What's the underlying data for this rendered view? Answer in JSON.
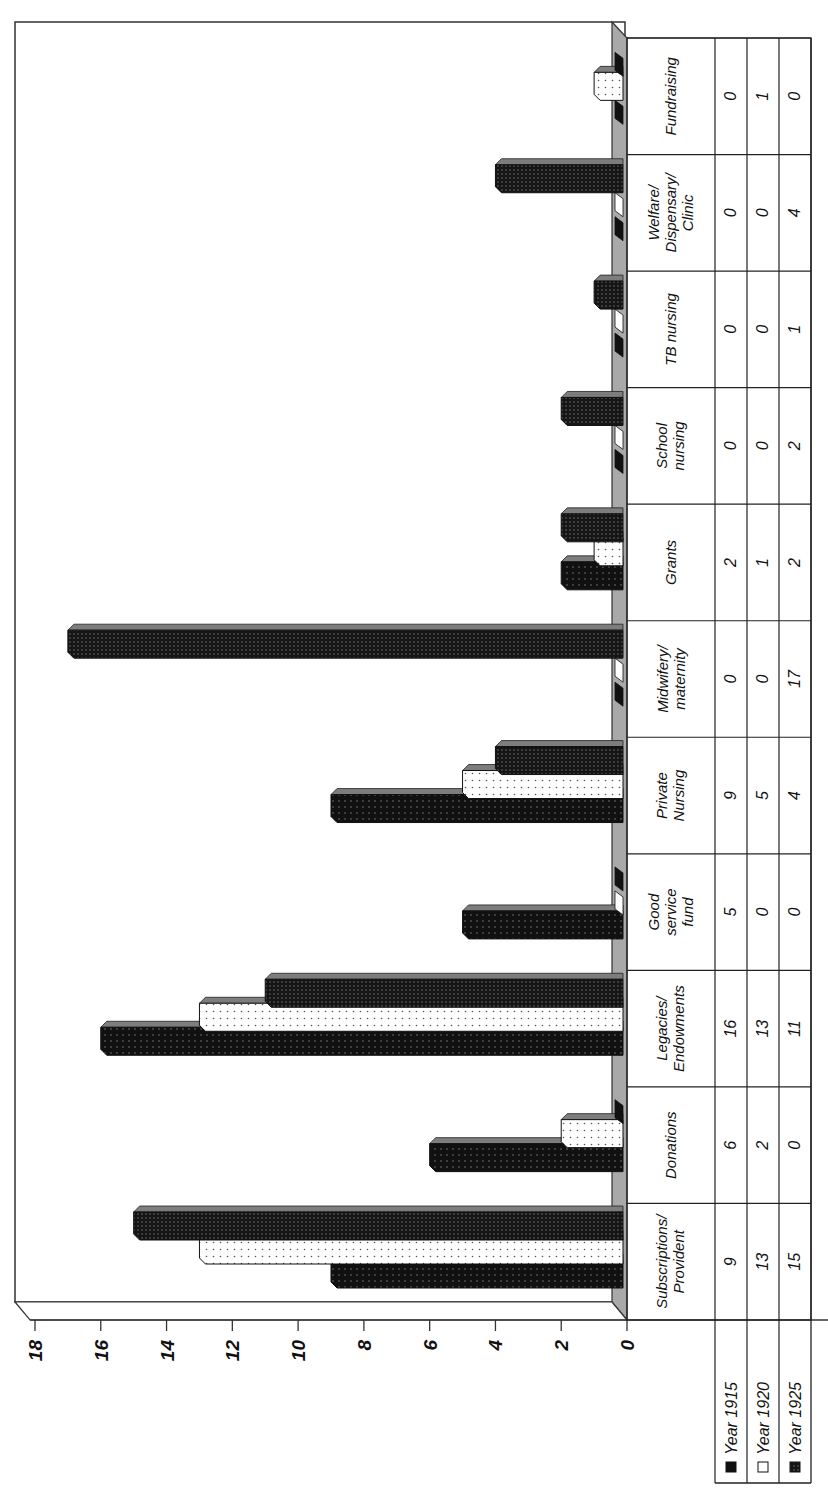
{
  "chart_data": {
    "type": "bar",
    "orientation": "horizontal-3d-rotated",
    "title": "",
    "xlabel": "",
    "ylabel": "",
    "ylim": [
      0,
      18
    ],
    "ticks": [
      0,
      2,
      4,
      6,
      8,
      10,
      12,
      14,
      16,
      18
    ],
    "grid": false,
    "legend_position": "data-table-bottom",
    "categories": [
      "Subscriptions/ Provident",
      "Donations",
      "Legacies/ Endowments",
      "Good service fund",
      "Private Nursing",
      "Midwifery/ maternity",
      "Grants",
      "School nursing",
      "TB nursing",
      "Welfare/ Dispensary/ Clinic",
      "Fundraising"
    ],
    "series": [
      {
        "name": "Year 1915",
        "pattern": "dark-dotted",
        "values": [
          9,
          6,
          16,
          5,
          9,
          0,
          2,
          0,
          0,
          0,
          0
        ]
      },
      {
        "name": "Year 1920",
        "pattern": "light-dotted",
        "values": [
          13,
          2,
          13,
          0,
          5,
          0,
          1,
          0,
          0,
          0,
          1
        ]
      },
      {
        "name": "Year 1925",
        "pattern": "dense-dotted",
        "values": [
          15,
          0,
          11,
          0,
          4,
          17,
          2,
          2,
          1,
          4,
          0
        ]
      }
    ]
  },
  "page": {
    "caption_partial": "...y ... ng ... ty ..."
  },
  "categories_display": [
    [
      "Subscriptions/",
      "Provident"
    ],
    [
      "Donations"
    ],
    [
      "Legacies/",
      "Endowments"
    ],
    [
      "Good",
      "service",
      "fund"
    ],
    [
      "Private",
      "Nursing"
    ],
    [
      "Midwifery/",
      "maternity"
    ],
    [
      "Grants"
    ],
    [
      "School",
      "nursing"
    ],
    [
      "TB nursing"
    ],
    [
      "Welfare/",
      "Dispensary/",
      "Clinic"
    ],
    [
      "Fundraising"
    ]
  ],
  "colors": {
    "dark": "#111111",
    "light": "#ffffff",
    "dense": "#1c1c1c",
    "floor": "#a6a6a6",
    "frame": "#333333"
  }
}
